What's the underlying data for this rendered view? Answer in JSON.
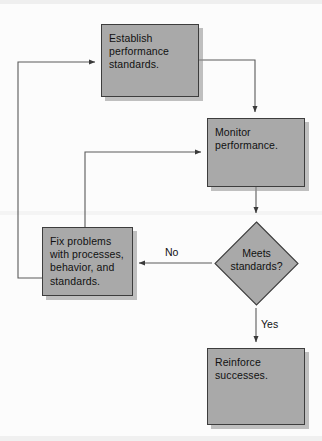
{
  "diagram": {
    "palette": {
      "node_fill": "#a9a9a9",
      "node_border": "#3d3d3d",
      "shadow": "#8c8c8c",
      "connector": "#4a4a4a",
      "background": "#fcfcfc",
      "text": "#111111"
    },
    "nodes": [
      {
        "id": "establish",
        "shape": "rectangle",
        "text": "Establish\nperformance\nstandards."
      },
      {
        "id": "monitor",
        "shape": "rectangle",
        "text": "Monitor\nperformance."
      },
      {
        "id": "decision",
        "shape": "diamond",
        "text": "Meets\nstandards?"
      },
      {
        "id": "fix",
        "shape": "rectangle",
        "text": "Fix problems\nwith processes,\nbehavior, and\nstandards."
      },
      {
        "id": "reinforce",
        "shape": "rectangle",
        "text": "Reinforce\nsuccesses."
      }
    ],
    "edge_labels": {
      "no": "No",
      "yes": "Yes"
    }
  }
}
